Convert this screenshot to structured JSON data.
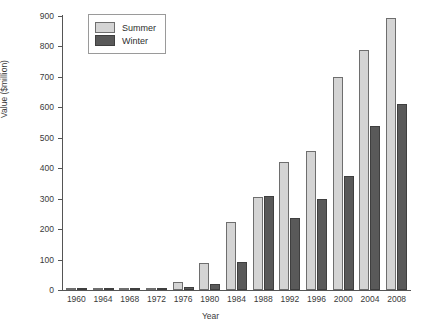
{
  "chart_data": {
    "type": "bar",
    "title": "",
    "xlabel": "Year",
    "ylabel": "Value ($million)",
    "categories": [
      "1960",
      "1964",
      "1968",
      "1972",
      "1976",
      "1980",
      "1984",
      "1988",
      "1992",
      "1996",
      "2000",
      "2004",
      "2008"
    ],
    "series": [
      {
        "name": "Summer",
        "color": "#d4d4d4",
        "values": [
          2,
          2,
          4,
          8,
          25,
          88,
          225,
          305,
          420,
          455,
          700,
          790,
          895
        ]
      },
      {
        "name": "Winter",
        "color": "#595959",
        "values": [
          1,
          1,
          3,
          6,
          10,
          20,
          93,
          310,
          235,
          300,
          375,
          540,
          610
        ]
      }
    ],
    "ylim": [
      0,
      900
    ],
    "yticks": [
      0,
      100,
      200,
      300,
      400,
      500,
      600,
      700,
      800,
      900
    ],
    "ytick_labels": [
      "0",
      "100",
      "200",
      "300",
      "400",
      "500",
      "600",
      "700",
      "800",
      "900"
    ],
    "grid": false,
    "legend_position": "top-left",
    "legend_entries": [
      "Summer",
      "Winter"
    ]
  }
}
